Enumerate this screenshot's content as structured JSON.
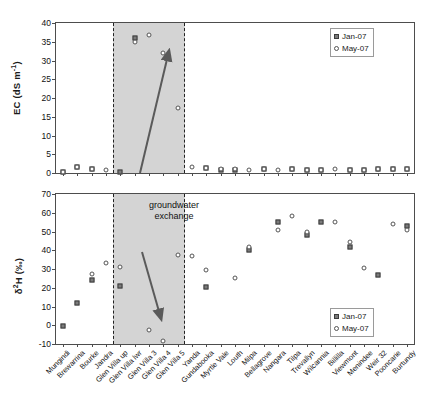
{
  "figure": {
    "background": "#ffffff",
    "shade_color": "#d4d4d4",
    "jan_color": "#7b7b7b",
    "may_color": "#ffffff",
    "arrow_color": "#5a5a5a"
  },
  "annotation": {
    "line1": "groundwater",
    "line2": "exchange"
  },
  "legend": {
    "jan_label": "Jan-07",
    "may_label": "May-07"
  },
  "categories": [
    "Mungindi",
    "Brewarrina",
    "Bourke",
    "Jandra",
    "Glen Villa up",
    "Glen Villa lwr",
    "Glen Villa 3",
    "Glen Villa 4",
    "Glen Villa 5",
    "Yanda",
    "Gundabooka",
    "Myrtle Vale",
    "Louth",
    "Milpa",
    "Bellagrove",
    "Nangara",
    "Tilpa",
    "Trevallyn",
    "Wilcannia",
    "Billilla",
    "Viewmont",
    "Menindee",
    "Weir 32",
    "Pooncarie",
    "Burtundy"
  ],
  "chart_data": [
    {
      "id": "ec-panel",
      "type": "scatter",
      "title": "",
      "xlabel": "",
      "ylabel": "EC (dS m-1)",
      "ylabel_parts": {
        "main": "EC (dS m",
        "sup": "-1",
        "tail": ")"
      },
      "ylim": [
        0,
        40
      ],
      "yticks": [
        0,
        5,
        10,
        15,
        20,
        25,
        30,
        35,
        40
      ],
      "ytick_labels": [
        "0",
        "5",
        "10",
        "15",
        "20",
        "25",
        "30",
        "35",
        "40"
      ],
      "grid": false,
      "legend_position": "top-right",
      "shaded_region": {
        "from_category": "Glen Villa up",
        "to_category": "Yanda"
      },
      "series": [
        {
          "name": "Jan-07",
          "marker": "filled-square",
          "values": [
            0.3,
            1.5,
            1.1,
            null,
            0.2,
            36.0,
            null,
            null,
            null,
            null,
            1.3,
            0.9,
            0.9,
            null,
            1.0,
            null,
            1.1,
            0.9,
            0.9,
            null,
            0.9,
            0.9,
            1.0,
            1.0,
            1.1
          ]
        },
        {
          "name": "May-07",
          "marker": "open-circle",
          "values": [
            0.3,
            1.5,
            1.2,
            0.9,
            null,
            35.0,
            36.8,
            32.0,
            17.3,
            1.7,
            1.4,
            1.0,
            1.0,
            0.9,
            1.0,
            0.8,
            1.0,
            0.9,
            0.9,
            1.1,
            0.9,
            0.9,
            1.0,
            1.0,
            1.1
          ]
        }
      ]
    },
    {
      "id": "d2h-panel",
      "type": "scatter",
      "title": "",
      "xlabel": "",
      "ylabel": "d2H (per mil)",
      "ylabel_parts": {
        "delta": "δ",
        "sup": "2",
        "tail": "H (‰)"
      },
      "ylim": [
        -10,
        70
      ],
      "yticks": [
        -10,
        0,
        10,
        20,
        30,
        40,
        50,
        60,
        70
      ],
      "ytick_labels": [
        "-10",
        "0",
        "10",
        "20",
        "30",
        "40",
        "50",
        "60",
        "70"
      ],
      "grid": false,
      "legend_position": "bottom-right",
      "shaded_region": {
        "from_category": "Glen Villa up",
        "to_category": "Yanda"
      },
      "series": [
        {
          "name": "Jan-07",
          "marker": "filled-square",
          "values": [
            -0.5,
            12.0,
            24.0,
            null,
            21.0,
            null,
            null,
            null,
            null,
            null,
            20.5,
            null,
            null,
            40.0,
            null,
            55.0,
            null,
            48.0,
            55.0,
            null,
            42.0,
            null,
            27.0,
            null,
            53.0
          ]
        },
        {
          "name": "May-07",
          "marker": "open-circle",
          "values": [
            null,
            null,
            27.5,
            33.0,
            31.0,
            null,
            -2.5,
            -8.5,
            37.5,
            37.0,
            29.5,
            null,
            25.0,
            41.5,
            null,
            51.0,
            58.5,
            50.0,
            null,
            55.0,
            44.5,
            30.5,
            null,
            54.0,
            51.0
          ]
        }
      ]
    }
  ]
}
